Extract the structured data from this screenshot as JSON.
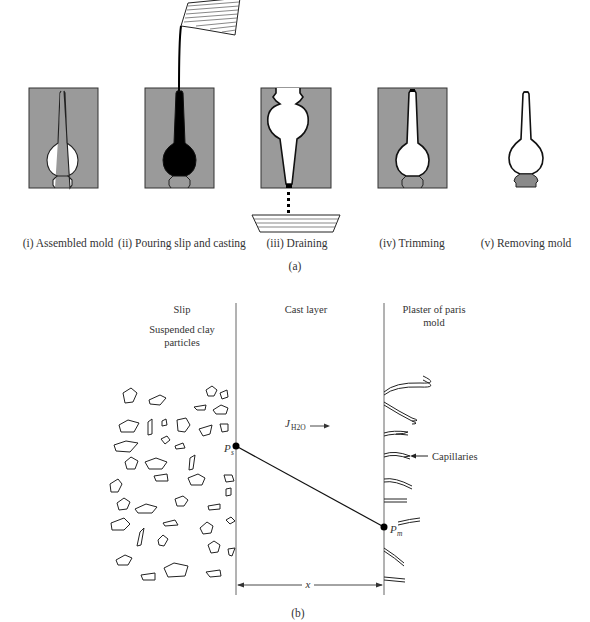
{
  "panel_a": {
    "steps": [
      {
        "label": "(i) Assembled mold"
      },
      {
        "label": "(ii) Pouring slip and casting"
      },
      {
        "label": "(iii) Draining"
      },
      {
        "label": "(iv) Trimming"
      },
      {
        "label": "(v) Removing mold"
      }
    ],
    "caption": "(a)"
  },
  "panel_b": {
    "regions": {
      "slip": "Slip",
      "slip_sub1": "Suspended clay",
      "slip_sub2": "particles",
      "cast": "Cast layer",
      "mold1": "Plaster of paris",
      "mold2": "mold"
    },
    "flux_symbol": "J",
    "flux_subscript": "H2O",
    "ps_label": "P",
    "ps_sub": "s",
    "pm_label": "P",
    "pm_sub": "m",
    "capillaries_label": "Capillaries",
    "x_label": "x",
    "caption": "(b)"
  },
  "colors": {
    "mold_gray": "#9a9a9a",
    "line": "#222222",
    "text": "#333333"
  }
}
